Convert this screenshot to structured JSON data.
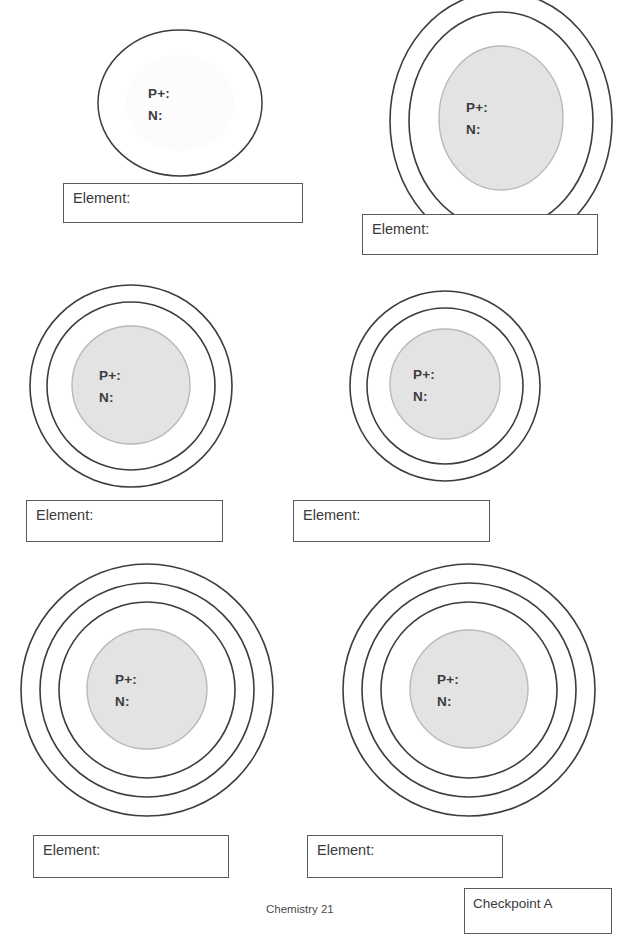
{
  "page": {
    "kind": "chemistry-worksheet",
    "background_color": "#ffffff",
    "ring_color": "#3d3d3d",
    "nucleus_fill": "#e3e3e3",
    "nucleus_stroke": "#b9b9b9",
    "box_border_color": "#5a5a5a",
    "text_color": "#3a3a3a"
  },
  "nucleus_labels": {
    "protons": "P+:",
    "neutrons": "N:"
  },
  "element_label": "Element:",
  "atoms": [
    {
      "id": "atom-1",
      "position": "top-left",
      "shells": 0,
      "has_nucleus_fill": false,
      "outline_shape": "ellipse",
      "protons": "P+:",
      "neutrons": "N:"
    },
    {
      "id": "atom-2",
      "position": "top-right",
      "shells": 2,
      "has_nucleus_fill": true,
      "outline_shape": "ellipse",
      "protons": "P+:",
      "neutrons": "N:"
    },
    {
      "id": "atom-3",
      "position": "middle-left",
      "shells": 2,
      "has_nucleus_fill": true,
      "outline_shape": "circle",
      "protons": "P+:",
      "neutrons": "N:"
    },
    {
      "id": "atom-4",
      "position": "middle-right",
      "shells": 2,
      "has_nucleus_fill": true,
      "outline_shape": "circle",
      "protons": "P+:",
      "neutrons": "N:"
    },
    {
      "id": "atom-5",
      "position": "bottom-left",
      "shells": 3,
      "has_nucleus_fill": true,
      "outline_shape": "circle",
      "protons": "P+:",
      "neutrons": "N:"
    },
    {
      "id": "atom-6",
      "position": "bottom-right",
      "shells": 3,
      "has_nucleus_fill": true,
      "outline_shape": "circle",
      "protons": "P+:",
      "neutrons": "N:"
    }
  ],
  "element_boxes": [
    {
      "id": "element-box-1",
      "label": "Element:",
      "value": ""
    },
    {
      "id": "element-box-2",
      "label": "Element:",
      "value": ""
    },
    {
      "id": "element-box-3",
      "label": "Element:",
      "value": ""
    },
    {
      "id": "element-box-4",
      "label": "Element:",
      "value": ""
    },
    {
      "id": "element-box-5",
      "label": "Element:",
      "value": ""
    },
    {
      "id": "element-box-6",
      "label": "Element:",
      "value": ""
    }
  ],
  "checkpoint": {
    "label": "Checkpoint A"
  },
  "footer": {
    "text": "Chemistry  21"
  }
}
